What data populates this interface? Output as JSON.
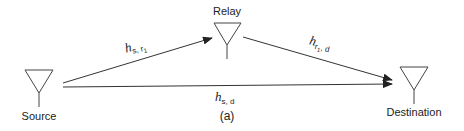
{
  "diagram": {
    "nodes": {
      "source": {
        "label": "Source"
      },
      "relay": {
        "label": "Relay"
      },
      "destination": {
        "label": "Destination"
      }
    },
    "edges": {
      "source_relay": {
        "symbol": "h",
        "sub_main": "s, r",
        "sub_index": "1"
      },
      "relay_destination": {
        "symbol": "h",
        "sub_main": "r",
        "sub_index": "1",
        "sub_tail": ", d"
      },
      "source_destination": {
        "symbol": "h",
        "sub_main": "s, d"
      }
    },
    "caption": "(a)",
    "colors": {
      "line": "#333333",
      "text": "#222222",
      "background": "#ffffff"
    }
  }
}
